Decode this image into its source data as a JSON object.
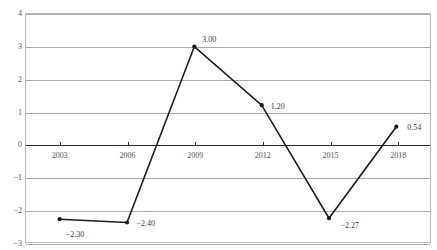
{
  "chart_data": {
    "type": "line",
    "title": "",
    "xlabel": "",
    "ylabel": "",
    "categories": [
      "2003",
      "2006",
      "2009",
      "2012",
      "2015",
      "2018"
    ],
    "values": [
      -2.3,
      -2.4,
      3.0,
      1.2,
      -2.27,
      0.54
    ],
    "point_labels": [
      "−2.30",
      "−2.40",
      "3.00",
      "1.20",
      "−2.27",
      "0.54"
    ],
    "ylim": [
      -3,
      4
    ],
    "ytick_labels": [
      "4",
      "3",
      "2",
      "1",
      "0",
      "−1",
      "−2",
      "−3"
    ],
    "ytick_values": [
      4,
      3,
      2,
      1,
      0,
      -1,
      -2,
      -3
    ],
    "grid": true,
    "legend": "none",
    "series_color": "#1a1a1a",
    "grid_color": "#a9a9ad",
    "zero_axis_color": "#2b2b2b",
    "frame_color": "#b9b9bf",
    "marker": "circle"
  },
  "label_offsets": [
    {
      "dx": 6,
      "dy": 10
    },
    {
      "dx": 9,
      "dy": -4
    },
    {
      "dx": 7,
      "dy": -11
    },
    {
      "dx": 8,
      "dy": -3
    },
    {
      "dx": 10,
      "dy": 2
    },
    {
      "dx": 9,
      "dy": -4
    }
  ]
}
